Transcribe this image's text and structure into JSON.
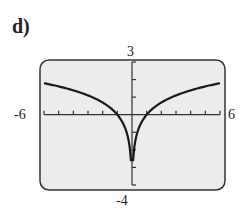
{
  "part_label": "d)",
  "window": {
    "xmin": "-6",
    "xmax": "6",
    "ymin": "-4",
    "ymax": "3"
  },
  "colors": {
    "screen_bg": "#ececec",
    "curve": "#1a1a1a",
    "border": "#333333"
  },
  "chart_data": {
    "type": "line",
    "title": "",
    "xlabel": "",
    "ylabel": "",
    "xlim": [
      -6,
      6
    ],
    "ylim": [
      -4,
      3
    ],
    "x_ticks_step": 1,
    "y_ticks_step": 1,
    "grid": false,
    "series": [
      {
        "name": "y = ln|x|",
        "x": [
          -6,
          -5,
          -4,
          -3,
          -2,
          -1,
          -0.5,
          -0.2,
          -0.1,
          0.1,
          0.2,
          0.5,
          1,
          2,
          3,
          4,
          5,
          6
        ],
        "values": [
          1.79,
          1.61,
          1.39,
          1.1,
          0.69,
          0,
          -0.69,
          -1.61,
          -2.3,
          -2.3,
          -1.61,
          -0.69,
          0,
          0.69,
          1.1,
          1.39,
          1.61,
          1.79
        ]
      }
    ]
  }
}
